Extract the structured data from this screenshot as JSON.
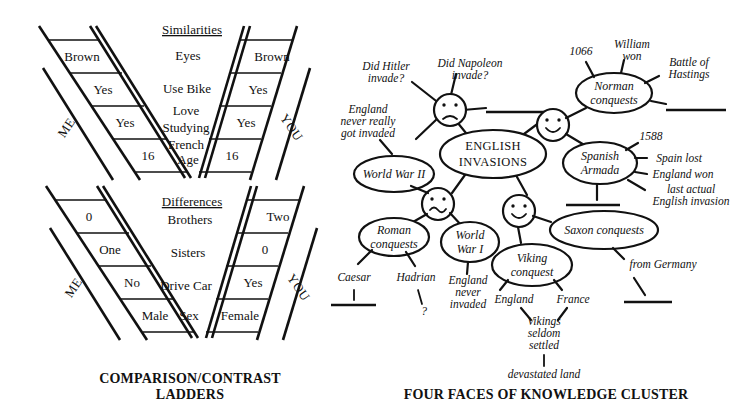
{
  "ladders": {
    "caption": "COMPARISON/CONTRAST LADDERS",
    "caption_line1": "COMPARISON/CONTRAST",
    "caption_line2": "LADDERS",
    "left_rail_label": "ME",
    "right_rail_label": "YOU",
    "similarities": {
      "title": "Similarities",
      "rows": [
        {
          "me": "Brown",
          "criterion": "Eyes",
          "you": "Brown"
        },
        {
          "me": "Yes",
          "criterion": "Use Bike",
          "you": "Yes"
        },
        {
          "me": "Yes",
          "criterion": "Love Studying French",
          "you": "Yes"
        },
        {
          "me": "16",
          "criterion": "Age",
          "you": "16"
        }
      ],
      "criterion_lines": [
        [
          "Eyes"
        ],
        [
          "Use Bike"
        ],
        [
          "Love",
          "Studying",
          "French"
        ],
        [
          "Age"
        ]
      ]
    },
    "differences": {
      "title": "Differences",
      "rows": [
        {
          "me": "0",
          "criterion": "Brothers",
          "you": "Two"
        },
        {
          "me": "One",
          "criterion": "Sisters",
          "you": "0"
        },
        {
          "me": "No",
          "criterion": "Drive Car",
          "you": "Yes"
        },
        {
          "me": "Male",
          "criterion": "Sex",
          "you": "Female"
        }
      ]
    }
  },
  "cluster": {
    "caption": "FOUR FACES OF KNOWLEDGE CLUSTER",
    "center": {
      "line1": "ENGLISH",
      "line2": "INVASIONS"
    },
    "faces": [
      {
        "id": "face-upper-left",
        "expression": "frowning"
      },
      {
        "id": "face-upper-right",
        "expression": "smiling"
      },
      {
        "id": "face-lower-left",
        "expression": "squiggly"
      },
      {
        "id": "face-lower-right",
        "expression": "smiling"
      }
    ],
    "nodes": [
      {
        "id": "world-war-2",
        "line1": "World War II"
      },
      {
        "id": "norman-conquests",
        "line1": "Norman",
        "line2": "conquests"
      },
      {
        "id": "spanish-armada",
        "line1": "Spanish",
        "line2": "Armada"
      },
      {
        "id": "roman-conquests",
        "line1": "Roman",
        "line2": "conquests"
      },
      {
        "id": "world-war-1",
        "line1": "World",
        "line2": "War I"
      },
      {
        "id": "viking-conquest",
        "line1": "Viking",
        "line2": "conquest"
      },
      {
        "id": "saxon-conquests",
        "line1": "Saxon conquests"
      }
    ],
    "leaves": {
      "did_hitler": [
        "Did Hitler",
        "invade?"
      ],
      "did_napoleon": [
        "Did Napoleon",
        "invade?"
      ],
      "england_never_really": [
        "England",
        "never really",
        "got invaded"
      ],
      "year_1066": "1066",
      "william_won": [
        "William",
        "won"
      ],
      "battle_of_hastings": [
        "Battle of",
        "Hastings"
      ],
      "year_1588": "1588",
      "spain_lost": "Spain lost",
      "england_won": "England won",
      "last_actual": [
        "last actual",
        "English invasion"
      ],
      "caesar": "Caesar",
      "hadrian": "Hadrian",
      "hadrian_question": "?",
      "england_never_invaded": [
        "England",
        "never",
        "invaded"
      ],
      "england": "England",
      "france": "France",
      "vikings_seldom_settled": [
        "Vikings",
        "seldom",
        "settled"
      ],
      "devastated_land": "devastated land",
      "from_germany": "from Germany"
    },
    "blank_lines_count": 5
  },
  "colors": {
    "ink": "#111111",
    "background": "#ffffff"
  }
}
